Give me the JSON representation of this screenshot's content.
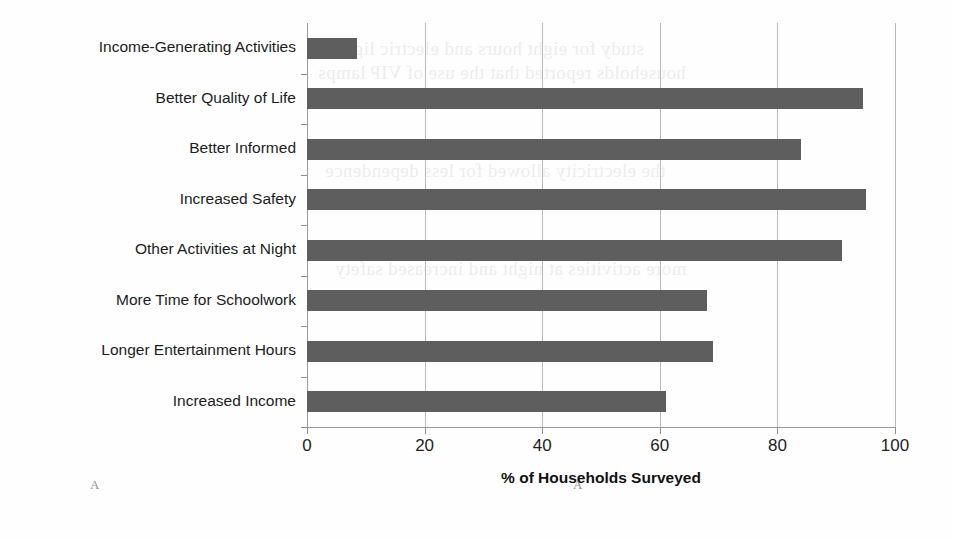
{
  "chart_data": {
    "type": "bar",
    "orientation": "horizontal",
    "title": "",
    "xlabel": "% of Households Surveyed",
    "ylabel": "",
    "xlim": [
      0,
      100
    ],
    "xticks": [
      0,
      20,
      40,
      60,
      80,
      100
    ],
    "xtick_labels": [
      "0",
      "20",
      "40",
      "60",
      "80",
      "100"
    ],
    "grid": "vertical",
    "legend": "none",
    "bar_color": "#5e5e5e",
    "categories": [
      "Income-Generating Activities",
      "Better Quality of Life",
      "Better Informed",
      "Increased Safety",
      "Other Activities at Night",
      "More Time for Schoolwork",
      "Longer Entertainment Hours",
      "Increased Income"
    ],
    "values": [
      8.5,
      94.5,
      84,
      95,
      91,
      68,
      69,
      61
    ]
  },
  "artifacts": {
    "bleed_text": [
      "study for eight hours and electric lights",
      "households reported that the use of VIP lamps",
      "the electricity allowed for less dependence",
      "more activities at night and increased safety"
    ],
    "scan_marks": [
      "A",
      "A"
    ]
  }
}
